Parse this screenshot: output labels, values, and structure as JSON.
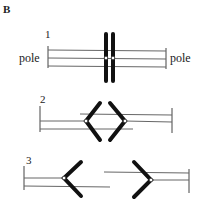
{
  "figure": {
    "panel_label": "B",
    "steps": [
      {
        "number": "1",
        "left_pole_label": "pole",
        "right_pole_label": "pole",
        "description": "paired chromosomes aligned at metaphase plate"
      },
      {
        "number": "2",
        "description": "sister chromatids begin separating, centromeres pulled toward opposite poles"
      },
      {
        "number": "3",
        "description": "chromatids migrate to opposite poles"
      }
    ],
    "colors": {
      "chromatid": "#111111",
      "spindle": "#666666",
      "centromere_fill": "#ffffff",
      "background": "#ffffff"
    }
  }
}
